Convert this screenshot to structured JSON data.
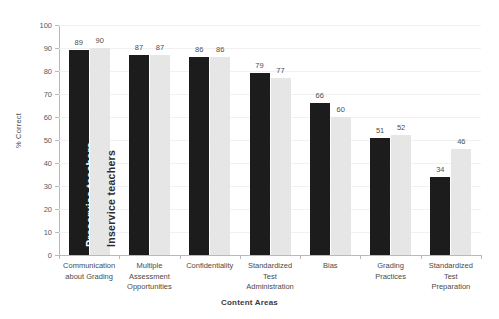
{
  "chart_data": {
    "type": "bar",
    "title": "",
    "xlabel": "Content Areas",
    "ylabel": "% Correct",
    "ylim": [
      0,
      100
    ],
    "ytick_step": 10,
    "grid": true,
    "legend_position": "inside-first-bars",
    "categories": [
      "Communication about Grading",
      "Multiple Assessment Opportunities",
      "Confidentiality",
      "Standardized Test Administration",
      "Bias",
      "Grading Practices",
      "Standardized Test Preparation"
    ],
    "category_lines": [
      [
        "Communication",
        "about Grading"
      ],
      [
        "Multiple",
        "Assessment",
        "Opportunities"
      ],
      [
        "Confidentiality"
      ],
      [
        "Standardized",
        "Test",
        "Administration"
      ],
      [
        "Bias"
      ],
      [
        "Grading",
        "Practices"
      ],
      [
        "Standardized",
        "Test",
        "Preparation"
      ]
    ],
    "yticks": [
      "0",
      "10",
      "20",
      "30",
      "40",
      "50",
      "60",
      "70",
      "80",
      "90",
      "100"
    ],
    "series": [
      {
        "name": "Preservice teachers",
        "color": "#1c1c1c",
        "values": [
          89,
          87,
          86,
          79,
          66,
          51,
          34
        ]
      },
      {
        "name": "Inservice teachers",
        "color": "#e6e6e6",
        "values": [
          90,
          87,
          86,
          77,
          60,
          52,
          46
        ]
      }
    ]
  },
  "colors": {
    "series_preservice": "#1c1c1c",
    "series_inservice": "#e6e6e6",
    "axis": "#b9b9b9",
    "grid": "#f1f1f1",
    "text": "#4a4a4a",
    "background": "#ffffff"
  }
}
